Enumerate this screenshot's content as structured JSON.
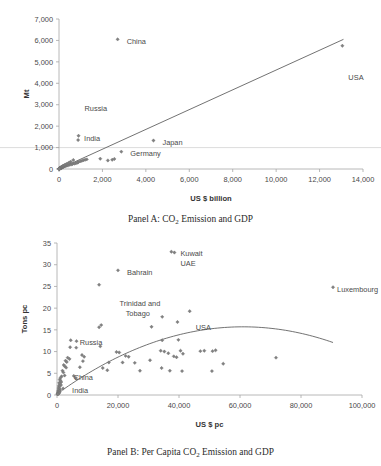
{
  "figure": {
    "panel_a_caption_prefix": "Panel A: CO",
    "panel_a_caption_sub": "2",
    "panel_a_caption_suffix": " Emission and GDP",
    "panel_b_caption_prefix": "Panel B: Per Capita CO",
    "panel_b_caption_sub": "2",
    "panel_b_caption_suffix": " Emission and GDP",
    "marker_color": "#808080",
    "trendline_color": "#595959",
    "axis_color": "#a6a6a6"
  },
  "chart_data": [
    {
      "id": "panel_a",
      "type": "scatter",
      "title": "Panel A: CO2 Emission and GDP",
      "xlabel": "US $ billion",
      "ylabel": "Mt",
      "xlim": [
        0,
        14000
      ],
      "ylim": [
        0,
        7000
      ],
      "xticks": [
        0,
        2000,
        4000,
        6000,
        8000,
        10000,
        12000,
        14000
      ],
      "xticklabels": [
        "0",
        "2,000",
        "4,000",
        "6,000",
        "8,000",
        "10,000",
        "12,000",
        "14,000"
      ],
      "yticks": [
        0,
        1000,
        2000,
        3000,
        4000,
        5000,
        6000,
        7000
      ],
      "yticklabels": [
        "0",
        "1,000",
        "2,000",
        "3,000",
        "4,000",
        "5,000",
        "6,000",
        "7,000"
      ],
      "grid": false,
      "legend": "none",
      "trendline": {
        "type": "linear",
        "x": [
          0,
          13100
        ],
        "y": [
          0,
          6050
        ]
      },
      "annotations": [
        {
          "text": "China",
          "x": 2700,
          "y": 6050,
          "dx": 9,
          "dy": 2
        },
        {
          "text": "USA",
          "x": 13050,
          "y": 5750,
          "dx": 6,
          "dy": 32
        },
        {
          "text": "Russia",
          "x": 900,
          "y": 1550,
          "dx": 6,
          "dy": -27
        },
        {
          "text": "India",
          "x": 880,
          "y": 1350,
          "dx": 6,
          "dy": -2
        },
        {
          "text": "Japan",
          "x": 4350,
          "y": 1330,
          "dx": 9,
          "dy": 2
        },
        {
          "text": "Germany",
          "x": 2870,
          "y": 810,
          "dx": 9,
          "dy": 2
        }
      ],
      "points": [
        {
          "x": 2700,
          "y": 6050,
          "label": "China"
        },
        {
          "x": 13050,
          "y": 5750,
          "label": "USA"
        },
        {
          "x": 900,
          "y": 1550,
          "label": "Russia"
        },
        {
          "x": 880,
          "y": 1350,
          "label": "India"
        },
        {
          "x": 4350,
          "y": 1330,
          "label": "Japan"
        },
        {
          "x": 2870,
          "y": 810,
          "label": "Germany"
        },
        {
          "x": 1900,
          "y": 480,
          "label": ""
        },
        {
          "x": 2250,
          "y": 400,
          "label": ""
        },
        {
          "x": 2450,
          "y": 430,
          "label": ""
        },
        {
          "x": 2550,
          "y": 470,
          "label": ""
        },
        {
          "x": 1280,
          "y": 450,
          "label": ""
        },
        {
          "x": 1200,
          "y": 430,
          "label": ""
        },
        {
          "x": 1120,
          "y": 410,
          "label": ""
        },
        {
          "x": 1050,
          "y": 380,
          "label": ""
        },
        {
          "x": 980,
          "y": 360,
          "label": ""
        },
        {
          "x": 900,
          "y": 330,
          "label": ""
        },
        {
          "x": 860,
          "y": 300,
          "label": ""
        },
        {
          "x": 820,
          "y": 285,
          "label": ""
        },
        {
          "x": 760,
          "y": 265,
          "label": ""
        },
        {
          "x": 700,
          "y": 250,
          "label": ""
        },
        {
          "x": 660,
          "y": 420,
          "label": ""
        },
        {
          "x": 620,
          "y": 230,
          "label": ""
        },
        {
          "x": 580,
          "y": 215,
          "label": ""
        },
        {
          "x": 540,
          "y": 340,
          "label": ""
        },
        {
          "x": 500,
          "y": 200,
          "label": ""
        },
        {
          "x": 470,
          "y": 300,
          "label": ""
        },
        {
          "x": 440,
          "y": 180,
          "label": ""
        },
        {
          "x": 410,
          "y": 255,
          "label": ""
        },
        {
          "x": 380,
          "y": 165,
          "label": ""
        },
        {
          "x": 350,
          "y": 230,
          "label": ""
        },
        {
          "x": 330,
          "y": 150,
          "label": ""
        },
        {
          "x": 310,
          "y": 205,
          "label": ""
        },
        {
          "x": 290,
          "y": 140,
          "label": ""
        },
        {
          "x": 270,
          "y": 185,
          "label": ""
        },
        {
          "x": 250,
          "y": 125,
          "label": ""
        },
        {
          "x": 240,
          "y": 170,
          "label": ""
        },
        {
          "x": 225,
          "y": 110,
          "label": ""
        },
        {
          "x": 215,
          "y": 155,
          "label": ""
        },
        {
          "x": 200,
          "y": 100,
          "label": ""
        },
        {
          "x": 190,
          "y": 140,
          "label": ""
        },
        {
          "x": 180,
          "y": 90,
          "label": ""
        },
        {
          "x": 170,
          "y": 128,
          "label": ""
        },
        {
          "x": 160,
          "y": 80,
          "label": ""
        },
        {
          "x": 150,
          "y": 115,
          "label": ""
        },
        {
          "x": 140,
          "y": 70,
          "label": ""
        },
        {
          "x": 132,
          "y": 105,
          "label": ""
        },
        {
          "x": 125,
          "y": 62,
          "label": ""
        },
        {
          "x": 118,
          "y": 95,
          "label": ""
        },
        {
          "x": 110,
          "y": 55,
          "label": ""
        },
        {
          "x": 103,
          "y": 85,
          "label": ""
        },
        {
          "x": 96,
          "y": 48,
          "label": ""
        },
        {
          "x": 90,
          "y": 75,
          "label": ""
        },
        {
          "x": 84,
          "y": 42,
          "label": ""
        },
        {
          "x": 78,
          "y": 66,
          "label": ""
        },
        {
          "x": 72,
          "y": 36,
          "label": ""
        },
        {
          "x": 66,
          "y": 58,
          "label": ""
        },
        {
          "x": 60,
          "y": 30,
          "label": ""
        },
        {
          "x": 55,
          "y": 50,
          "label": ""
        },
        {
          "x": 50,
          "y": 25,
          "label": ""
        },
        {
          "x": 45,
          "y": 43,
          "label": ""
        },
        {
          "x": 40,
          "y": 20,
          "label": ""
        },
        {
          "x": 36,
          "y": 36,
          "label": ""
        },
        {
          "x": 32,
          "y": 16,
          "label": ""
        },
        {
          "x": 28,
          "y": 30,
          "label": ""
        },
        {
          "x": 24,
          "y": 12,
          "label": ""
        },
        {
          "x": 20,
          "y": 24,
          "label": ""
        },
        {
          "x": 17,
          "y": 9,
          "label": ""
        },
        {
          "x": 14,
          "y": 18,
          "label": ""
        },
        {
          "x": 11,
          "y": 7,
          "label": ""
        },
        {
          "x": 9,
          "y": 13,
          "label": ""
        },
        {
          "x": 7,
          "y": 5,
          "label": ""
        },
        {
          "x": 5,
          "y": 9,
          "label": ""
        },
        {
          "x": 3,
          "y": 3,
          "label": ""
        }
      ]
    },
    {
      "id": "panel_b",
      "type": "scatter",
      "title": "Panel B: Per Capita CO2 Emission and GDP",
      "xlabel": "US $ pc",
      "ylabel": "Tons pc",
      "xlim": [
        0,
        100000
      ],
      "ylim": [
        0,
        35
      ],
      "xticks": [
        0,
        20000,
        40000,
        60000,
        80000,
        100000
      ],
      "xticklabels": [
        "0",
        "20,000",
        "40,000",
        "60,000",
        "80,000",
        "100,000"
      ],
      "yticks": [
        0,
        5,
        10,
        15,
        20,
        25,
        30,
        35
      ],
      "yticklabels": [
        "0",
        "5",
        "10",
        "15",
        "20",
        "25",
        "30",
        "35"
      ],
      "grid": false,
      "legend": "none",
      "trendline": {
        "type": "quadratic",
        "vertex_x": 61000,
        "vertex_y": 15.7,
        "x_start": 1500,
        "x_end": 90500,
        "y_start": 1.0,
        "y_end": 12.6
      },
      "annotations": [
        {
          "text": "Kuwait",
          "x": 37500,
          "y": 33.0,
          "dx": 9,
          "dy": 2
        },
        {
          "text": "UAE",
          "x": 37500,
          "y": 33.0,
          "dx": 9,
          "dy": 12
        },
        {
          "text": "Bahrain",
          "x": 20000,
          "y": 28.7,
          "dx": 9,
          "dy": 2
        },
        {
          "text": "Trinidad and",
          "x": 20500,
          "y": 21.2,
          "dx": 0,
          "dy": 0
        },
        {
          "text": "Tobago",
          "x": 22500,
          "y": 18.7,
          "dx": 0,
          "dy": 0
        },
        {
          "text": "USA",
          "x": 43500,
          "y": 19.3,
          "dx": 6,
          "dy": 16
        },
        {
          "text": "Luxembourg",
          "x": 90500,
          "y": 24.8,
          "dx": 4,
          "dy": 2
        },
        {
          "text": "Russia",
          "x": 4500,
          "y": 12.6,
          "dx": 9,
          "dy": 2
        },
        {
          "text": "China",
          "x": 2500,
          "y": 4.5,
          "dx": 9,
          "dy": 2
        },
        {
          "text": "India",
          "x": 2000,
          "y": 1.5,
          "dx": 9,
          "dy": 2
        }
      ],
      "points": [
        {
          "x": 37500,
          "y": 33.0,
          "label": "Kuwait"
        },
        {
          "x": 38500,
          "y": 32.8,
          "label": "UAE"
        },
        {
          "x": 20000,
          "y": 28.7,
          "label": "Bahrain"
        },
        {
          "x": 13800,
          "y": 25.4,
          "label": ""
        },
        {
          "x": 90500,
          "y": 24.8,
          "label": "Luxembourg"
        },
        {
          "x": 43500,
          "y": 19.3,
          "label": "USA"
        },
        {
          "x": 34500,
          "y": 18.0,
          "label": ""
        },
        {
          "x": 39500,
          "y": 16.8,
          "label": ""
        },
        {
          "x": 14500,
          "y": 16.1,
          "label": ""
        },
        {
          "x": 13800,
          "y": 15.6,
          "label": ""
        },
        {
          "x": 31000,
          "y": 15.7,
          "label": ""
        },
        {
          "x": 34500,
          "y": 12.6,
          "label": ""
        },
        {
          "x": 39800,
          "y": 12.7,
          "label": ""
        },
        {
          "x": 4500,
          "y": 12.6,
          "label": "Russia"
        },
        {
          "x": 6400,
          "y": 12.4,
          "label": ""
        },
        {
          "x": 14200,
          "y": 11.2,
          "label": ""
        },
        {
          "x": 4300,
          "y": 11.0,
          "label": ""
        },
        {
          "x": 6300,
          "y": 10.9,
          "label": ""
        },
        {
          "x": 19500,
          "y": 9.9,
          "label": ""
        },
        {
          "x": 20400,
          "y": 9.8,
          "label": ""
        },
        {
          "x": 34000,
          "y": 10.2,
          "label": ""
        },
        {
          "x": 35200,
          "y": 10.0,
          "label": ""
        },
        {
          "x": 36500,
          "y": 9.6,
          "label": ""
        },
        {
          "x": 40500,
          "y": 10.2,
          "label": ""
        },
        {
          "x": 41300,
          "y": 9.5,
          "label": ""
        },
        {
          "x": 47000,
          "y": 10.1,
          "label": ""
        },
        {
          "x": 48300,
          "y": 10.2,
          "label": ""
        },
        {
          "x": 51000,
          "y": 10.1,
          "label": ""
        },
        {
          "x": 52000,
          "y": 10.3,
          "label": ""
        },
        {
          "x": 71800,
          "y": 8.6,
          "label": ""
        },
        {
          "x": 8200,
          "y": 9.2,
          "label": ""
        },
        {
          "x": 8900,
          "y": 8.8,
          "label": ""
        },
        {
          "x": 3500,
          "y": 8.6,
          "label": ""
        },
        {
          "x": 4100,
          "y": 8.3,
          "label": ""
        },
        {
          "x": 23500,
          "y": 8.8,
          "label": ""
        },
        {
          "x": 22500,
          "y": 9.0,
          "label": ""
        },
        {
          "x": 30500,
          "y": 8.0,
          "label": ""
        },
        {
          "x": 38300,
          "y": 8.9,
          "label": ""
        },
        {
          "x": 39200,
          "y": 8.7,
          "label": ""
        },
        {
          "x": 2800,
          "y": 7.9,
          "label": ""
        },
        {
          "x": 3200,
          "y": 7.6,
          "label": ""
        },
        {
          "x": 8500,
          "y": 7.8,
          "label": ""
        },
        {
          "x": 21500,
          "y": 7.5,
          "label": ""
        },
        {
          "x": 25500,
          "y": 7.4,
          "label": ""
        },
        {
          "x": 17000,
          "y": 7.5,
          "label": ""
        },
        {
          "x": 54500,
          "y": 7.2,
          "label": ""
        },
        {
          "x": 2200,
          "y": 6.9,
          "label": ""
        },
        {
          "x": 2600,
          "y": 6.6,
          "label": ""
        },
        {
          "x": 3000,
          "y": 6.3,
          "label": ""
        },
        {
          "x": 7500,
          "y": 6.4,
          "label": ""
        },
        {
          "x": 15000,
          "y": 6.2,
          "label": ""
        },
        {
          "x": 16500,
          "y": 5.7,
          "label": ""
        },
        {
          "x": 27200,
          "y": 5.6,
          "label": ""
        },
        {
          "x": 34300,
          "y": 6.2,
          "label": ""
        },
        {
          "x": 41000,
          "y": 5.5,
          "label": ""
        },
        {
          "x": 37000,
          "y": 5.6,
          "label": ""
        },
        {
          "x": 50800,
          "y": 5.5,
          "label": ""
        },
        {
          "x": 1800,
          "y": 5.6,
          "label": ""
        },
        {
          "x": 2100,
          "y": 5.2,
          "label": ""
        },
        {
          "x": 2500,
          "y": 4.5,
          "label": "China"
        },
        {
          "x": 1500,
          "y": 4.3,
          "label": ""
        },
        {
          "x": 1200,
          "y": 4.0,
          "label": ""
        },
        {
          "x": 5500,
          "y": 4.4,
          "label": ""
        },
        {
          "x": 6200,
          "y": 3.9,
          "label": ""
        },
        {
          "x": 900,
          "y": 3.6,
          "label": ""
        },
        {
          "x": 1100,
          "y": 3.3,
          "label": ""
        },
        {
          "x": 1400,
          "y": 3.0,
          "label": ""
        },
        {
          "x": 700,
          "y": 2.8,
          "label": ""
        },
        {
          "x": 950,
          "y": 2.5,
          "label": ""
        },
        {
          "x": 1300,
          "y": 2.3,
          "label": ""
        },
        {
          "x": 600,
          "y": 2.1,
          "label": ""
        },
        {
          "x": 850,
          "y": 1.9,
          "label": ""
        },
        {
          "x": 2000,
          "y": 1.5,
          "label": "India"
        },
        {
          "x": 500,
          "y": 1.6,
          "label": ""
        },
        {
          "x": 750,
          "y": 1.4,
          "label": ""
        },
        {
          "x": 1050,
          "y": 1.2,
          "label": ""
        },
        {
          "x": 400,
          "y": 1.1,
          "label": ""
        },
        {
          "x": 650,
          "y": 0.9,
          "label": ""
        },
        {
          "x": 900,
          "y": 0.8,
          "label": ""
        },
        {
          "x": 300,
          "y": 0.7,
          "label": ""
        },
        {
          "x": 550,
          "y": 0.6,
          "label": ""
        },
        {
          "x": 800,
          "y": 0.5,
          "label": ""
        },
        {
          "x": 250,
          "y": 0.4,
          "label": ""
        },
        {
          "x": 450,
          "y": 0.35,
          "label": ""
        },
        {
          "x": 200,
          "y": 0.25,
          "label": ""
        },
        {
          "x": 350,
          "y": 0.2,
          "label": ""
        },
        {
          "x": 150,
          "y": 0.15,
          "label": ""
        }
      ]
    }
  ]
}
